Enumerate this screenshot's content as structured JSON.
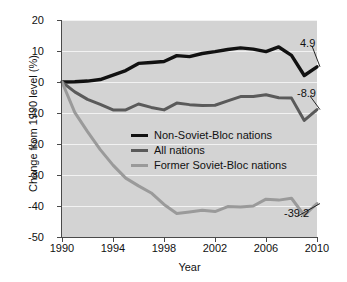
{
  "chart_data": {
    "type": "line",
    "title": "",
    "xlabel": "Year",
    "ylabel": "Change from 1990 level (%)",
    "xlim": [
      1990,
      2010
    ],
    "ylim": [
      -50,
      20
    ],
    "grid": true,
    "legend_position": "center",
    "xticks": [
      1990,
      1994,
      1998,
      2002,
      2006,
      2010
    ],
    "yticks": [
      20,
      10,
      0,
      -10,
      -20,
      -30,
      -40,
      -50
    ],
    "x": [
      1990,
      1991,
      1992,
      1993,
      1994,
      1995,
      1996,
      1997,
      1998,
      1999,
      2000,
      2001,
      2002,
      2003,
      2004,
      2005,
      2006,
      2007,
      2008,
      2009,
      2010
    ],
    "series": [
      {
        "name": "Non-Soviet-Bloc nations",
        "color": "#111111",
        "width": 3.4,
        "values": [
          0.0,
          0.1,
          0.3,
          0.8,
          2.2,
          3.7,
          6.0,
          6.3,
          6.6,
          8.5,
          8.2,
          9.2,
          9.8,
          10.5,
          11.0,
          10.6,
          9.8,
          11.3,
          8.6,
          2.1,
          4.9
        ],
        "end_label": "4.9",
        "end_value": 4.9
      },
      {
        "name": "All nations",
        "color": "#5a5a5a",
        "width": 3.0,
        "values": [
          0.0,
          -3.2,
          -5.6,
          -7.2,
          -9.0,
          -9.0,
          -7.1,
          -8.2,
          -9.0,
          -6.8,
          -7.3,
          -7.6,
          -7.5,
          -6.1,
          -4.7,
          -4.7,
          -4.1,
          -5.1,
          -5.2,
          -12.4,
          -8.9
        ],
        "end_label": "-8.9",
        "end_value": -8.9
      },
      {
        "name": "Former Soviet-Bloc nations",
        "color": "#9a9a9a",
        "width": 3.0,
        "values": [
          0.0,
          -9.8,
          -16.0,
          -21.8,
          -26.8,
          -31.0,
          -33.5,
          -35.8,
          -39.5,
          -42.4,
          -41.9,
          -41.4,
          -41.8,
          -40.2,
          -40.3,
          -40.0,
          -37.8,
          -38.1,
          -37.5,
          -43.0,
          -39.2
        ],
        "end_label": "-39.2",
        "end_value": -39.2
      }
    ]
  },
  "axes": {
    "ylabel": "Change from 1990 level (%)",
    "xlabel": "Year",
    "ytick_labels": [
      "20",
      "10",
      "0",
      "-10",
      "-20",
      "-30",
      "-40",
      "-50"
    ],
    "xtick_labels": [
      "1990",
      "1994",
      "1998",
      "2002",
      "2006",
      "2010"
    ]
  },
  "legend": {
    "items": [
      {
        "label": "Non-Soviet-Bloc nations",
        "swatch": "legend-line-black"
      },
      {
        "label": "All nations",
        "swatch": "legend-line-dark-gray"
      },
      {
        "label": "Former Soviet-Bloc nations",
        "swatch": "legend-line-light-gray"
      }
    ]
  },
  "annotations": {
    "top": "4.9",
    "middle": "-8.9",
    "bottom": "-39.2"
  },
  "colors": {
    "panel_background": "#d3d3d3",
    "gridline": "#f2f2f2",
    "axis": "#4a4a4a",
    "series_non_soviet": "#111111",
    "series_all": "#5a5a5a",
    "series_former_soviet": "#9a9a9a",
    "text": "#111111"
  }
}
